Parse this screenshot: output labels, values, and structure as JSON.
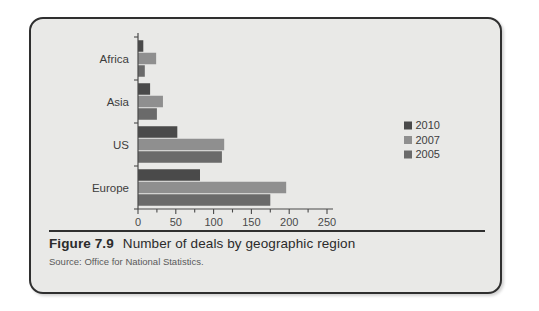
{
  "figure": {
    "number": "Figure 7.9",
    "caption": "Number of deals by geographic region",
    "source": "Source: Office for National Statistics."
  },
  "colors": {
    "series_2010": "#4a4a4a",
    "series_2007": "#8f8f8f",
    "series_2005": "#6a6a6a",
    "card_background": "#e9e9e7",
    "card_border": "#2f2f2f",
    "axis": "#4a4a4a"
  },
  "axis": {
    "ticks": [
      "0",
      "50",
      "100",
      "150",
      "200",
      "250"
    ],
    "minor_step": 25
  },
  "categories": [
    "Africa",
    "Asia",
    "US",
    "Europe"
  ],
  "legend": {
    "entries": [
      {
        "label": "2010",
        "color": "#4a4a4a"
      },
      {
        "label": "2007",
        "color": "#8f8f8f"
      },
      {
        "label": "2005",
        "color": "#6a6a6a"
      }
    ]
  },
  "chart_data": {
    "type": "bar",
    "orientation": "horizontal",
    "title": "Number of deals by geographic region",
    "subtitle": "",
    "xlabel": "",
    "ylabel": "",
    "xlim": [
      0,
      250
    ],
    "grid": false,
    "legend_position": "right",
    "categories": [
      "Africa",
      "Asia",
      "US",
      "Europe"
    ],
    "series": [
      {
        "name": "2010",
        "color": "#4a4a4a",
        "values": [
          7,
          16,
          52,
          82
        ]
      },
      {
        "name": "2007",
        "color": "#8f8f8f",
        "values": [
          24,
          33,
          114,
          196
        ]
      },
      {
        "name": "2005",
        "color": "#6a6a6a",
        "values": [
          9,
          25,
          111,
          175
        ]
      }
    ],
    "xticks": [
      0,
      50,
      100,
      150,
      200,
      250
    ]
  }
}
